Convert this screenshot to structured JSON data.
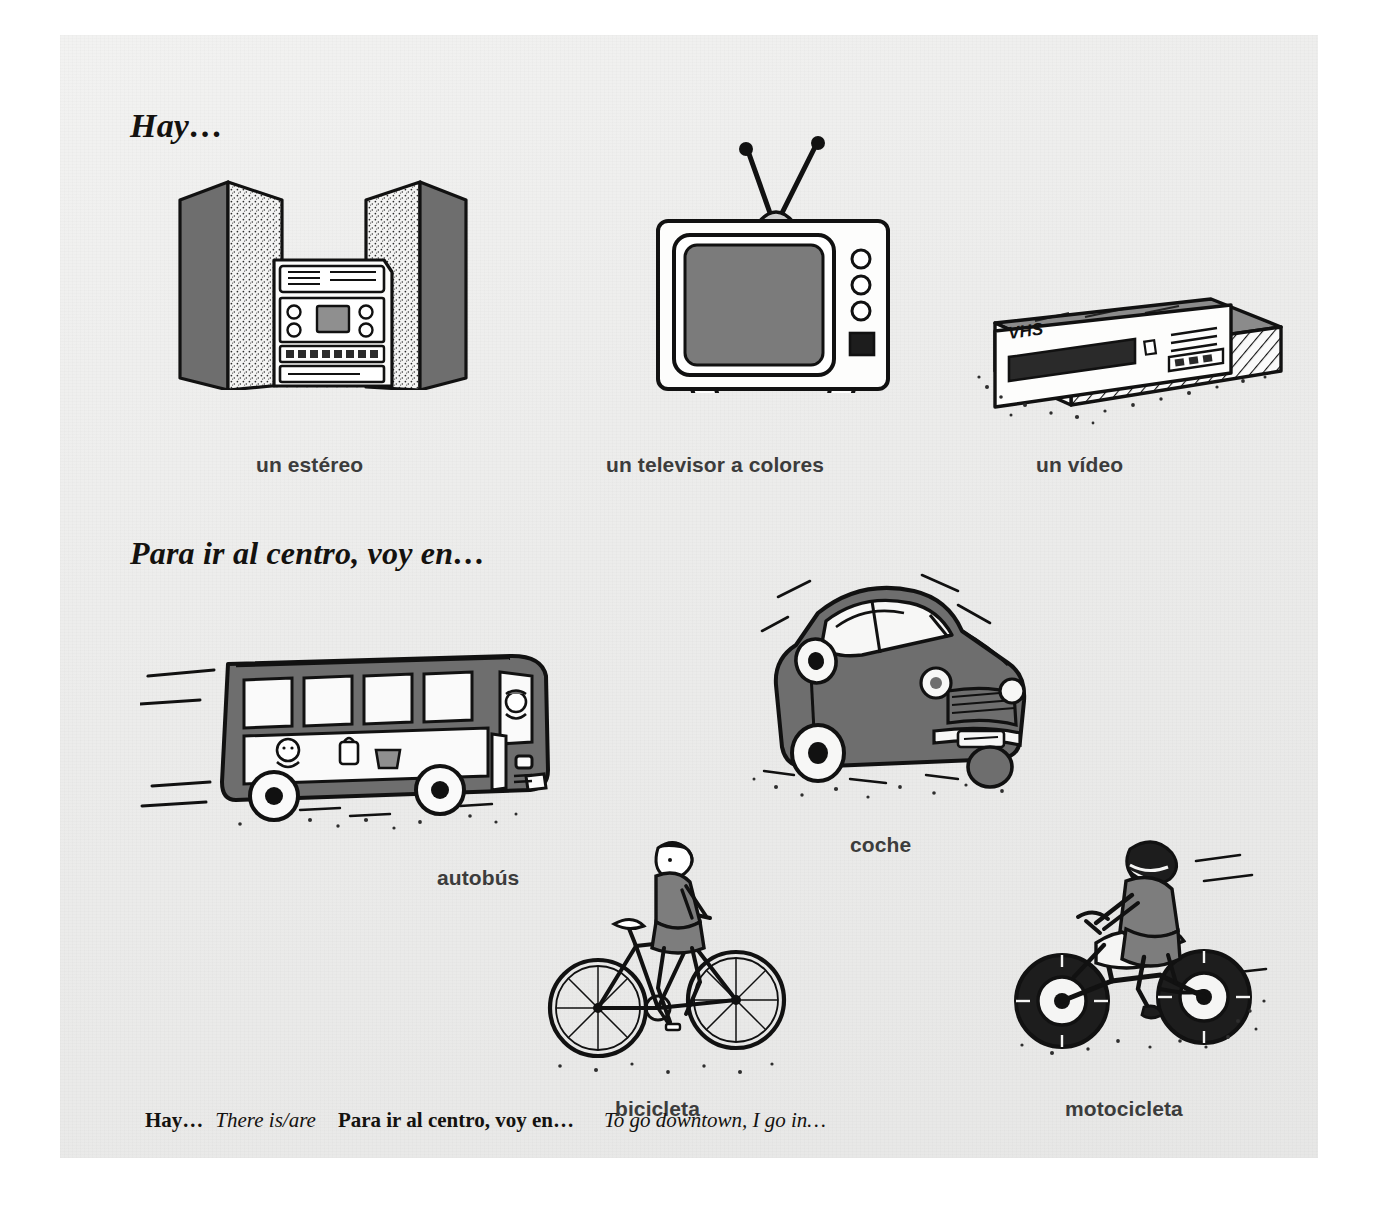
{
  "page": {
    "background_color": "#ececeb",
    "ink_color": "#14120f",
    "label_color": "#3c3c3c"
  },
  "sections": [
    {
      "id": "hay",
      "heading": "Hay…",
      "items": [
        {
          "label": "un estéreo",
          "icon": "stereo-system-illustration"
        },
        {
          "label": "un televisor a colores",
          "icon": "television-illustration"
        },
        {
          "label": "un vídeo",
          "icon": "vcr-illustration"
        }
      ]
    },
    {
      "id": "transporte",
      "heading": "Para ir al centro, voy en…",
      "items": [
        {
          "label": "autobús",
          "icon": "bus-illustration"
        },
        {
          "label": "coche",
          "icon": "car-illustration"
        },
        {
          "label": "bicicleta",
          "icon": "bicycle-illustration"
        },
        {
          "label": "motocicleta",
          "icon": "motorcycle-illustration"
        }
      ]
    }
  ],
  "vcr_face_text": "VHS",
  "glossary": {
    "entry1_spanish": "Hay…",
    "entry1_english": "There is/are",
    "entry2_spanish": "Para ir al centro,  voy en…",
    "entry2_english": "To go downtown,  I go in…"
  }
}
